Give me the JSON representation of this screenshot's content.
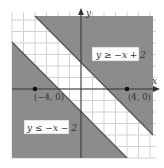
{
  "chart_data": {
    "type": "area",
    "title": "",
    "xlabel": "x",
    "ylabel": "y",
    "xlim": [
      -6,
      6.3
    ],
    "ylim": [
      -6,
      6.3
    ],
    "grid": true,
    "grid_step": 1,
    "series": [
      {
        "name": "y ≥ −x + 2",
        "boundary": "y = -x + 2",
        "inequality": ">=",
        "slope": -1,
        "intercept": 2,
        "shaded": "above",
        "color": "#8c8c8c"
      },
      {
        "name": "y ≤ −x − 2",
        "boundary": "y = -x - 2",
        "inequality": "<=",
        "slope": -1,
        "intercept": -2,
        "shaded": "below",
        "color": "#8c8c8c"
      }
    ],
    "points": [
      {
        "label": "(−4, 0)",
        "x": -4,
        "y": 0
      },
      {
        "label": "(4, 0)",
        "x": 4,
        "y": 0
      }
    ],
    "annotations": [
      {
        "text": "y ≥ −x + 2",
        "region": "upper-right"
      },
      {
        "text": "y ≤ −x − 2",
        "region": "lower-left"
      }
    ]
  },
  "labels": {
    "x_axis": "x",
    "y_axis": "y",
    "upper_region": "y ≥ −x + 2",
    "lower_region": "y ≤ −x − 2",
    "point_left": "(−4, 0)",
    "point_right": "(4, 0)"
  },
  "colors": {
    "shade": "#8c8c8c",
    "grid": "#cfcfcf",
    "axis": "#333333",
    "label_box": "#ffffff"
  }
}
